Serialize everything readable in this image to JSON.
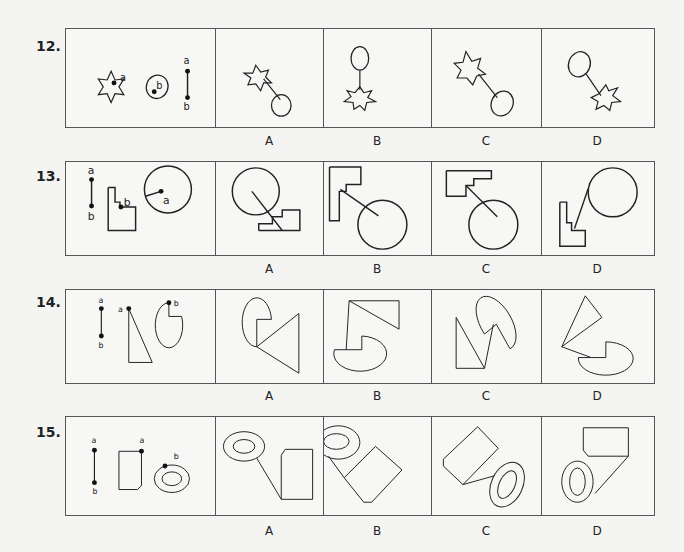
{
  "questions": [
    {
      "number": "12.",
      "given_labels": {
        "point_a_star": "a",
        "point_b_ellipse": "b",
        "segment_top": "a",
        "segment_bottom": "b"
      },
      "options": [
        "A",
        "B",
        "C",
        "D"
      ]
    },
    {
      "number": "13.",
      "given_labels": {
        "segment_top": "a",
        "segment_bottom": "b",
        "point_b_stair": "b",
        "point_a_circle": "a"
      },
      "options": [
        "A",
        "B",
        "C",
        "D"
      ]
    },
    {
      "number": "14.",
      "given_labels": {
        "segment_top": "a",
        "segment_bottom": "b",
        "point_a_triangle": "a",
        "point_b_pacman": "b"
      },
      "options": [
        "A",
        "B",
        "C",
        "D"
      ]
    },
    {
      "number": "15.",
      "given_labels": {
        "segment_top": "a",
        "segment_bottom": "b",
        "point_a_pentagon": "a",
        "point_b_ring": "b"
      },
      "options": [
        "A",
        "B",
        "C",
        "D"
      ]
    }
  ],
  "colors": {
    "stroke": "#222222",
    "border": "#555555",
    "background": "#f4f4f2"
  }
}
